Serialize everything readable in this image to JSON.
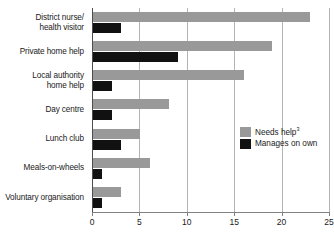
{
  "chart_data": {
    "type": "bar",
    "orientation": "horizontal",
    "title": "",
    "subtitle": "",
    "xlabel": "",
    "ylabel": "",
    "xlim": [
      0,
      25
    ],
    "xticks": [
      0,
      5,
      10,
      15,
      20,
      25
    ],
    "xtick_labels": [
      "0",
      "5",
      "10",
      "15",
      "20",
      "25"
    ],
    "grid": "vertical",
    "legend_position": "inside-right",
    "categories": [
      "District nurse/ health visitor",
      "Private home help",
      "Local authority home help",
      "Day centre",
      "Lunch club",
      "Meals-on-wheels",
      "Voluntary organisation"
    ],
    "category_lines": [
      [
        "District nurse/",
        "health visitor"
      ],
      [
        "Private home help"
      ],
      [
        "Local authority",
        "home help"
      ],
      [
        "Day centre"
      ],
      [
        "Lunch club"
      ],
      [
        "Meals-on-wheels"
      ],
      [
        "Voluntary organisation"
      ]
    ],
    "series": [
      {
        "name": "Needs help",
        "name_superscript": "3",
        "color": "#999999",
        "values": [
          23,
          19,
          16,
          8,
          5,
          6,
          3
        ]
      },
      {
        "name": "Manages on own",
        "name_superscript": "",
        "color": "#111111",
        "values": [
          3,
          9,
          2,
          2,
          3,
          1,
          1
        ]
      }
    ]
  },
  "legend": {
    "entries": [
      {
        "label": "Needs help",
        "superscript": "3",
        "swatch": "needs-help"
      },
      {
        "label": "Manages on own",
        "superscript": "",
        "swatch": "manages-own"
      }
    ]
  },
  "colors": {
    "needs_help": "#999999",
    "manages_on_own": "#111111",
    "gridline": "#b4b4b4",
    "axis": "#808080",
    "text": "#1a1a1a",
    "background": "#ffffff"
  }
}
